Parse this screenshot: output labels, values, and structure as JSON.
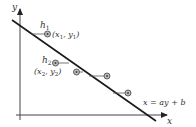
{
  "diagram": {
    "axes": {
      "x_label": "x",
      "y_label": "y",
      "color": "#333333"
    },
    "regression_line": {
      "equation_label": "x = ay + b",
      "color": "#1a1a1a"
    },
    "points": [
      {
        "residual_label": "h",
        "residual_sub": "1",
        "coord_label": "(x",
        "coord_sub1": "1",
        "coord_mid": ", y",
        "coord_sub2": "1",
        "coord_end": ")"
      },
      {
        "residual_label": "h",
        "residual_sub": "2",
        "coord_label": "(x",
        "coord_sub1": "2",
        "coord_mid": ", y",
        "coord_sub2": "2",
        "coord_end": ")"
      },
      {},
      {},
      {}
    ],
    "point_color": "#555555"
  }
}
